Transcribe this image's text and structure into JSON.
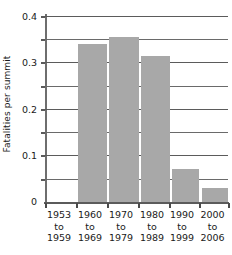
{
  "chart_data": {
    "type": "bar",
    "title": "",
    "xlabel": "",
    "ylabel": "Fatalities per summit",
    "categories": [
      "1953 to 1959",
      "1960 to 1969",
      "1970 to 1979",
      "1980 to 1989",
      "1990 to 1999",
      "2000 to 2006"
    ],
    "category_lines": [
      [
        "1953",
        "to",
        "1959"
      ],
      [
        "1960",
        "to",
        "1969"
      ],
      [
        "1970",
        "to",
        "1979"
      ],
      [
        "1980",
        "to",
        "1989"
      ],
      [
        "1990",
        "to",
        "1999"
      ],
      [
        "2000",
        "to",
        "2006"
      ]
    ],
    "values": [
      0,
      0.34,
      0.355,
      0.315,
      0.07,
      0.03
    ],
    "ylim": [
      0,
      0.4
    ],
    "ytick_labels": [
      "0.4",
      "0.3",
      "0.2",
      "0.1",
      "0"
    ],
    "ytick_values": [
      0.4,
      0.3,
      0.2,
      0.1,
      0
    ],
    "gridline_values": [
      0.4,
      0.35,
      0.3,
      0.25,
      0.2,
      0.15,
      0.1,
      0.05
    ],
    "grid": true,
    "legend": "none",
    "bar_color": "#a8a8a8",
    "axis_color": "#5b5b5b",
    "background": "#ffffff"
  }
}
